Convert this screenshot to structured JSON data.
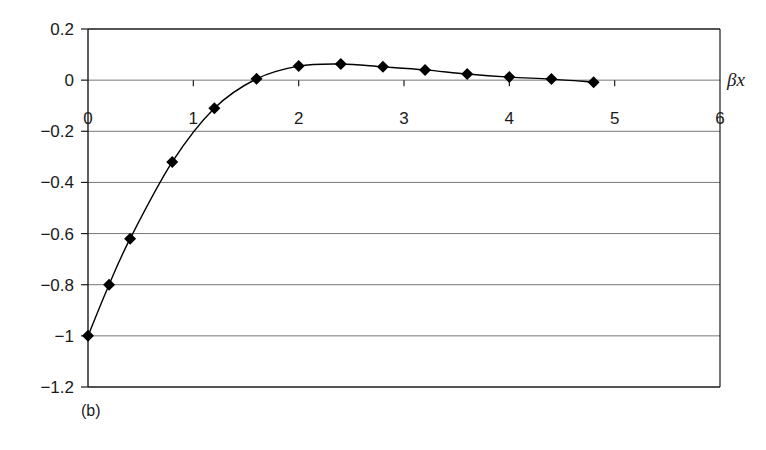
{
  "chart_data": {
    "type": "line",
    "title": "",
    "panel_label": "(b)",
    "xlabel": "βx",
    "ylabel": "",
    "xlim": [
      0,
      6
    ],
    "ylim": [
      -1.2,
      0.2
    ],
    "x_ticks": [
      0,
      1,
      2,
      3,
      4,
      5,
      6
    ],
    "x_tick_labels": [
      "0",
      "1",
      "2",
      "3",
      "4",
      "5",
      "6"
    ],
    "y_ticks": [
      0.2,
      0,
      -0.2,
      -0.4,
      -0.6,
      -0.8,
      -1,
      -1.2
    ],
    "y_tick_labels": [
      "0.2",
      "0",
      "−0.2",
      "−0.4",
      "−0.6",
      "−0.8",
      "−1",
      "−1.2"
    ],
    "grid": {
      "horizontal": true,
      "vertical": false
    },
    "legend": null,
    "series": [
      {
        "name": "curve",
        "marker": "diamond",
        "line": "smooth",
        "color": "#000000",
        "x": [
          0,
          0.2,
          0.4,
          0.8,
          1.2,
          1.6,
          2.0,
          2.4,
          2.8,
          3.2,
          3.6,
          4.0,
          4.4,
          4.8
        ],
        "y": [
          -1.0,
          -0.8,
          -0.62,
          -0.32,
          -0.11,
          0.005,
          0.055,
          0.063,
          0.052,
          0.04,
          0.024,
          0.012,
          0.004,
          -0.008
        ]
      }
    ]
  },
  "colors": {
    "axis": "#1a1a1a",
    "grid": "#777777",
    "marker": "#000000",
    "background": "#ffffff"
  }
}
